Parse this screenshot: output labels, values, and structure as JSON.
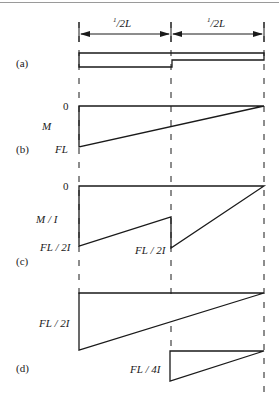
{
  "figure": {
    "dimension_labels": {
      "left_half": "1/2L",
      "right_half": "1/2L",
      "left_half_sup": "1",
      "left_half_rest": "/2L",
      "right_half_sup": "1",
      "right_half_rest": "/2L"
    },
    "panels": {
      "a": {
        "tag": "(a)",
        "description": "stepped beam"
      },
      "b": {
        "tag": "(b)",
        "axis_label": "M",
        "zero_label": "0",
        "max_label": "FL"
      },
      "c": {
        "tag": "(c)",
        "axis_label": "M / I",
        "zero_label": "0",
        "left_label": "FL / 2I",
        "mid_label": "FL / 2I"
      },
      "d": {
        "tag": "(d)",
        "large_label": "FL / 2I",
        "small_label": "FL / 4I"
      }
    },
    "colors": {
      "line": "#1a1a1a",
      "background": "#ffffff",
      "rule": "#9a9a9a"
    }
  }
}
